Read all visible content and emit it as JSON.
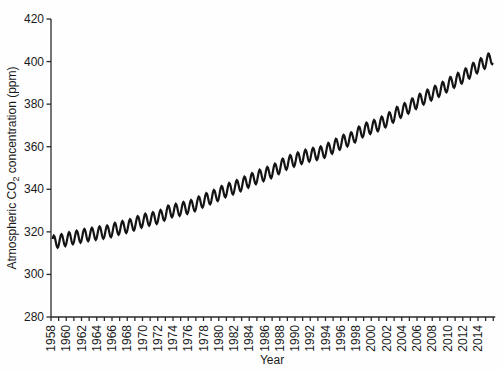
{
  "chart_data": {
    "type": "line",
    "title": "",
    "xlabel": "Year",
    "ylabel": "Atmospheric CO2 concentration (ppm)",
    "ylabel_parts": {
      "pre": "Atmospheric CO",
      "sub": "2",
      "post": " concentration (ppm)"
    },
    "xlim": [
      1958,
      2016
    ],
    "ylim": [
      280,
      420
    ],
    "yticks": [
      280,
      300,
      320,
      340,
      360,
      380,
      400,
      420
    ],
    "xtick_labels": [
      "1958",
      "1960",
      "1962",
      "1964",
      "1966",
      "1968",
      "1970",
      "1972",
      "1974",
      "1976",
      "1978",
      "1980",
      "1982",
      "1984",
      "1986",
      "1988",
      "1990",
      "1992",
      "1994",
      "1996",
      "1998",
      "2000",
      "2002",
      "2004",
      "2006",
      "2008",
      "2010",
      "2012",
      "2014"
    ],
    "minor_xtick_interval_years": 1,
    "grid": false,
    "legend": false,
    "line_color": "#141414",
    "series": [
      {
        "name": "Atmospheric CO2 concentration (Mauna Loa)",
        "start_year": 1958,
        "start_decimal_year": 1958.2,
        "end_decimal_year": 2016.0,
        "sampling": "monthly with seasonal cycle",
        "seasonal_amplitude_ppm": 3.0,
        "annual_mean_ppm": [
          315.34,
          315.97,
          316.91,
          317.64,
          318.45,
          318.99,
          319.62,
          320.04,
          321.37,
          322.18,
          323.05,
          324.62,
          325.68,
          326.32,
          327.46,
          329.68,
          330.19,
          331.12,
          332.03,
          333.84,
          335.41,
          336.84,
          338.76,
          340.12,
          341.48,
          343.15,
          344.85,
          346.35,
          347.61,
          349.31,
          351.69,
          353.2,
          354.45,
          355.7,
          356.54,
          357.21,
          358.96,
          360.97,
          362.74,
          363.88,
          366.84,
          368.54,
          369.71,
          371.32,
          373.45,
          375.98,
          377.7,
          379.98,
          382.09,
          384.02,
          385.83,
          387.64,
          390.1,
          391.85,
          394.06,
          396.74,
          398.81,
          401.02
        ]
      }
    ]
  }
}
